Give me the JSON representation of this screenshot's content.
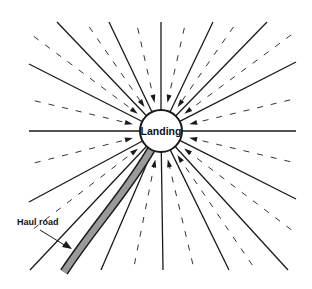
{
  "diagram": {
    "center_label": "Landing",
    "road_label": "Haul road",
    "solid_line_count": 16,
    "flow_direction": "inward toward landing",
    "colors": {
      "line": "#1a1a1a",
      "road_fill": "#9a9a9a",
      "background": "#ffffff"
    }
  }
}
